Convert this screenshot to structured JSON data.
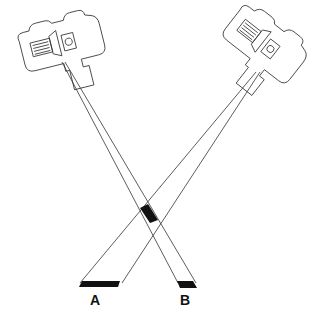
{
  "diagram": {
    "labels": {
      "a": "A",
      "b": "B"
    },
    "colors": {
      "line": "#333333",
      "fill": "#111111",
      "background": "#ffffff"
    },
    "elements": {
      "left_camera": "camera-left",
      "right_camera": "camera-right",
      "beam_to_b": "beam from left camera to target B",
      "beam_to_a": "beam from right camera to target A",
      "crossing": "beam intersection (shaded)"
    }
  }
}
